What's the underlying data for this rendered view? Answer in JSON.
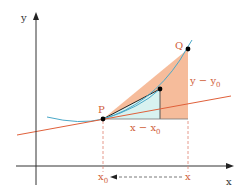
{
  "diagram": {
    "axes": {
      "x_label": "x",
      "y_label": "y"
    },
    "points": {
      "P": "P",
      "Q": "Q"
    },
    "labels": {
      "dy": "y − y",
      "dy_sub": "0",
      "dx": "x − x",
      "dx_sub": "0",
      "x0": "x",
      "x0_sub": "0",
      "x": "x"
    },
    "colors": {
      "axis": "#333333",
      "curve": "#4aa8c8",
      "tangent": "#e0603a",
      "secant_fill": "#f5b08a",
      "inner_fill": "#d8f2f0",
      "label": "#d0603a",
      "dashed": "#e08070",
      "point": "#000000"
    }
  }
}
